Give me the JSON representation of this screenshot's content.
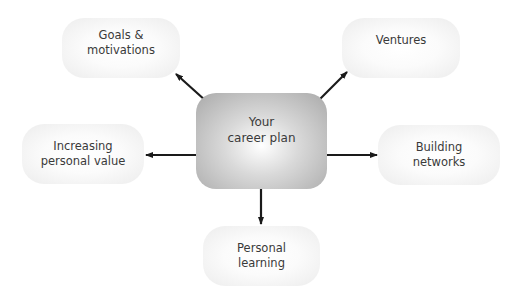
{
  "diagram": {
    "center": {
      "label": "Your\ncareer plan"
    },
    "nodes": [
      {
        "id": "goals",
        "label": "Goals &\nmotivations"
      },
      {
        "id": "ventures",
        "label": "Ventures"
      },
      {
        "id": "increasing",
        "label": "Increasing\npersonal value"
      },
      {
        "id": "building",
        "label": "Building\nnetworks"
      },
      {
        "id": "learning",
        "label": "Personal\nlearning"
      }
    ],
    "edges": [
      {
        "from": "center",
        "to": "goals"
      },
      {
        "from": "center",
        "to": "ventures"
      },
      {
        "from": "center",
        "to": "increasing"
      },
      {
        "from": "center",
        "to": "building"
      },
      {
        "from": "center",
        "to": "learning"
      }
    ]
  }
}
